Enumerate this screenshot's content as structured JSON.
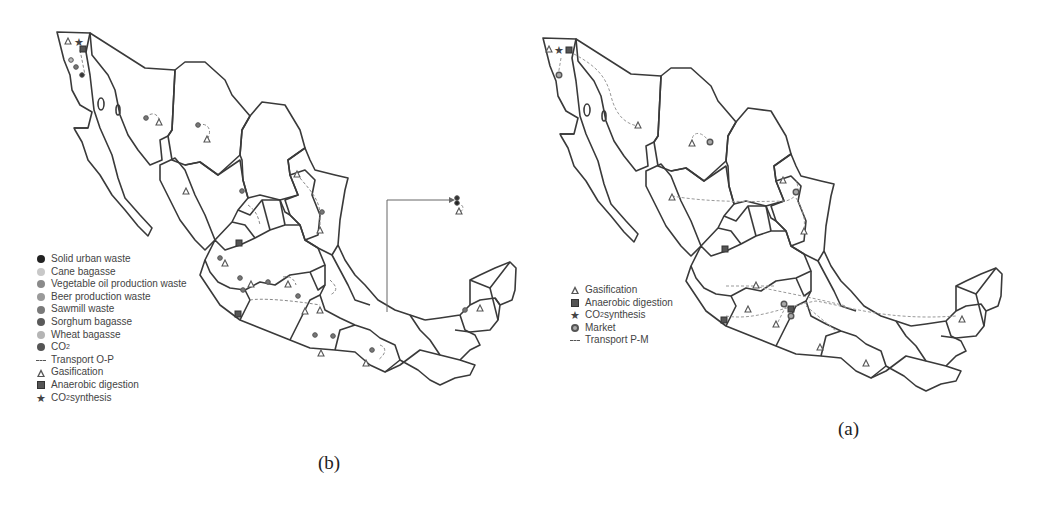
{
  "figure": {
    "panels": [
      {
        "id": "b",
        "caption": "(b)",
        "legend": [
          {
            "symbol": "filled-circle",
            "color": "#222222",
            "label": "Solid urban waste"
          },
          {
            "symbol": "filled-circle",
            "color": "#c8c8c8",
            "label": "Cane bagasse"
          },
          {
            "symbol": "filled-circle",
            "color": "#8a8a8a",
            "label": "Vegetable oil production waste"
          },
          {
            "symbol": "filled-circle",
            "color": "#9a9a9a",
            "label": "Beer production waste"
          },
          {
            "symbol": "filled-circle",
            "color": "#7a7a7a",
            "label": "Sawmill waste"
          },
          {
            "symbol": "filled-circle",
            "color": "#5a5a5a",
            "label": "Sorghum bagasse"
          },
          {
            "symbol": "filled-circle",
            "color": "#b5b5b5",
            "label": "Wheat bagasse"
          },
          {
            "symbol": "filled-circle",
            "color": "#555555",
            "label": "CO",
            "sub": "2",
            "suffix": ""
          },
          {
            "symbol": "dashed-line",
            "color": "#555555",
            "label": "Transport O-P"
          },
          {
            "symbol": "triangle",
            "color": "#555555",
            "label": "Gasification"
          },
          {
            "symbol": "square",
            "color": "#555555",
            "label": "Anaerobic digestion"
          },
          {
            "symbol": "star",
            "color": "#444444",
            "label": "CO",
            "sub": "2",
            "suffix": " synthesis"
          }
        ]
      },
      {
        "id": "a",
        "caption": "(a)",
        "legend": [
          {
            "symbol": "triangle",
            "color": "#555555",
            "label": "Gasification"
          },
          {
            "symbol": "square",
            "color": "#555555",
            "label": "Anaerobic digestion"
          },
          {
            "symbol": "star",
            "color": "#444444",
            "label": "CO",
            "sub": "2",
            "suffix": " synthesis"
          },
          {
            "symbol": "ring",
            "color": "#555555",
            "label": "Market"
          },
          {
            "symbol": "dashed-line",
            "color": "#555555",
            "label": "Transport P-M"
          }
        ]
      }
    ],
    "map_subject": "Mexico (state boundaries)",
    "colors": {
      "outline": "#3a3a3a",
      "route": "#8a8a8a",
      "background": "#ffffff"
    }
  }
}
